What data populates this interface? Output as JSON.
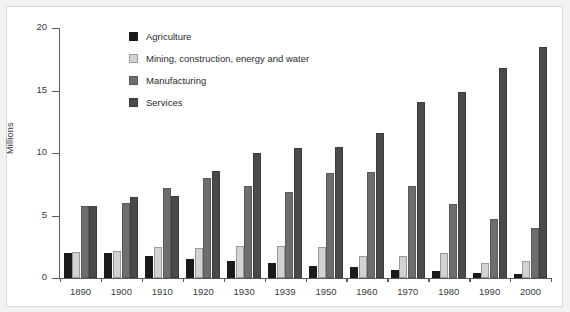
{
  "chart_data": {
    "type": "bar",
    "title": "",
    "subtitle": "",
    "xlabel": "",
    "ylabel": "Millions",
    "ylim": [
      0,
      20
    ],
    "yticks": [
      0,
      5,
      10,
      15,
      20
    ],
    "grid": false,
    "legend_position": "top-left-inside",
    "categories": [
      "1890",
      "1900",
      "1910",
      "1920",
      "1930",
      "1939",
      "1950",
      "1960",
      "1970",
      "1980",
      "1990",
      "2000"
    ],
    "series": [
      {
        "name": "Agriculture",
        "color": "#1a1a1a",
        "values": [
          2.0,
          2.0,
          1.8,
          1.5,
          1.4,
          1.2,
          1.0,
          0.9,
          0.65,
          0.55,
          0.4,
          0.3
        ]
      },
      {
        "name": "Mining, construction, energy and water",
        "color": "#d2d2d2",
        "values": [
          2.1,
          2.2,
          2.5,
          2.4,
          2.6,
          2.6,
          2.5,
          1.8,
          1.8,
          2.0,
          1.2,
          1.4
        ]
      },
      {
        "name": "Manufacturing",
        "color": "#6e6e6e",
        "values": [
          5.8,
          6.0,
          7.2,
          8.0,
          7.4,
          6.9,
          8.4,
          8.5,
          7.4,
          5.9,
          4.7,
          4.0
        ]
      },
      {
        "name": "Services",
        "color": "#4a4a4a",
        "values": [
          5.8,
          6.5,
          6.6,
          8.6,
          10.0,
          10.4,
          10.5,
          11.6,
          14.1,
          14.9,
          16.8,
          18.5
        ]
      }
    ]
  },
  "axis": {
    "y_title": "Millions"
  },
  "legend": {
    "items": [
      {
        "label": "Agriculture"
      },
      {
        "label": "Mining, construction, energy and water"
      },
      {
        "label": "Manufacturing"
      },
      {
        "label": "Services"
      }
    ]
  }
}
